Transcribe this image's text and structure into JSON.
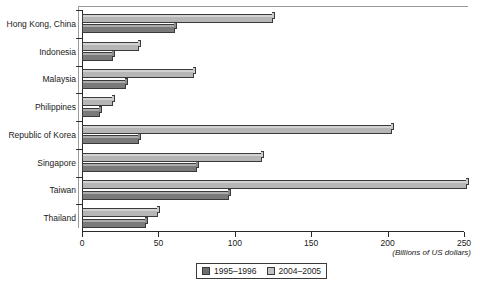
{
  "chart_data": {
    "type": "bar",
    "orientation": "horizontal",
    "title": "",
    "xlabel": "(Billions of US dollars)",
    "ylabel": "",
    "xlim": [
      0,
      250
    ],
    "xticks": [
      0,
      50,
      100,
      150,
      200,
      250
    ],
    "xtick_labels": [
      "0",
      "50",
      "100",
      "150",
      "200",
      "250"
    ],
    "grid": false,
    "legend_position": "bottom-center",
    "categories": [
      "Hong Kong, China",
      "Indonesia",
      "Malaysia",
      "Philippines",
      "Republic of Korea",
      "Singapore",
      "Taiwan",
      "Thailand"
    ],
    "series": [
      {
        "name": "1995–1996",
        "color": "#7a7a7a",
        "values": [
          61,
          20,
          29,
          12,
          37,
          75,
          96,
          42
        ]
      },
      {
        "name": "2004–2005",
        "color": "#b6b6b6",
        "values": [
          125,
          37,
          73,
          20,
          203,
          118,
          252,
          50
        ]
      }
    ]
  },
  "legend": {
    "items": [
      {
        "label": "1995–1996",
        "swatch": "dark-gray-swatch"
      },
      {
        "label": "2004–2005",
        "swatch": "light-gray-swatch"
      }
    ]
  },
  "axis": {
    "x_title": "(Billions of US dollars)"
  }
}
